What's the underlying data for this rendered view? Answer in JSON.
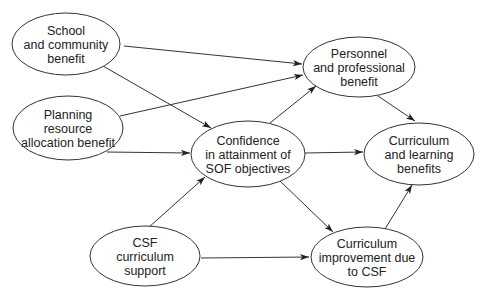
{
  "diagram": {
    "type": "path-diagram",
    "nodes": [
      {
        "id": "school",
        "lines": [
          "School",
          "and community",
          "benefit"
        ],
        "cx": 66,
        "cy": 44,
        "rx": 54,
        "ry": 31
      },
      {
        "id": "planning",
        "lines": [
          "Planning",
          "resource",
          "allocation benefit"
        ],
        "cx": 68,
        "cy": 128,
        "rx": 55,
        "ry": 32
      },
      {
        "id": "confidence",
        "lines": [
          "Confidence",
          "in attainment of",
          "SOF objectives"
        ],
        "cx": 248,
        "cy": 154,
        "rx": 57,
        "ry": 33
      },
      {
        "id": "personnel",
        "lines": [
          "Personnel",
          "and professional",
          "benefit"
        ],
        "cx": 359,
        "cy": 67,
        "rx": 56,
        "ry": 30
      },
      {
        "id": "curriculum_learning",
        "lines": [
          "Curriculum",
          "and learning",
          "benefits"
        ],
        "cx": 419,
        "cy": 154,
        "rx": 55,
        "ry": 31
      },
      {
        "id": "csf_support",
        "lines": [
          "CSF",
          "curriculum",
          "support"
        ],
        "cx": 145,
        "cy": 256,
        "rx": 55,
        "ry": 30
      },
      {
        "id": "curriculum_improvement",
        "lines": [
          "Curriculum",
          "improvement due",
          "to CSF"
        ],
        "cx": 367,
        "cy": 257,
        "rx": 56,
        "ry": 30
      }
    ],
    "edges": [
      {
        "from": "school",
        "to": "personnel",
        "x1": 124,
        "y1": 46,
        "x2": 302,
        "y2": 64
      },
      {
        "from": "school",
        "to": "confidence",
        "x1": 103,
        "y1": 66,
        "x2": 211,
        "y2": 128
      },
      {
        "from": "planning",
        "to": "personnel",
        "x1": 120,
        "y1": 116,
        "x2": 303,
        "y2": 75
      },
      {
        "from": "planning",
        "to": "confidence",
        "x1": 107,
        "y1": 152,
        "x2": 190,
        "y2": 153
      },
      {
        "from": "confidence",
        "to": "personnel",
        "x1": 270,
        "y1": 123,
        "x2": 316,
        "y2": 86
      },
      {
        "from": "confidence",
        "to": "curriculum_learning",
        "x1": 305,
        "y1": 153,
        "x2": 363,
        "y2": 152
      },
      {
        "from": "confidence",
        "to": "curriculum_improvement",
        "x1": 280,
        "y1": 181,
        "x2": 333,
        "y2": 232
      },
      {
        "from": "personnel",
        "to": "curriculum_learning",
        "x1": 378,
        "y1": 96,
        "x2": 415,
        "y2": 121
      },
      {
        "from": "csf_support",
        "to": "confidence",
        "x1": 148,
        "y1": 228,
        "x2": 205,
        "y2": 177
      },
      {
        "from": "csf_support",
        "to": "curriculum_improvement",
        "x1": 201,
        "y1": 258,
        "x2": 309,
        "y2": 257
      },
      {
        "from": "curriculum_improvement",
        "to": "curriculum_learning",
        "x1": 385,
        "y1": 229,
        "x2": 412,
        "y2": 185
      }
    ]
  }
}
